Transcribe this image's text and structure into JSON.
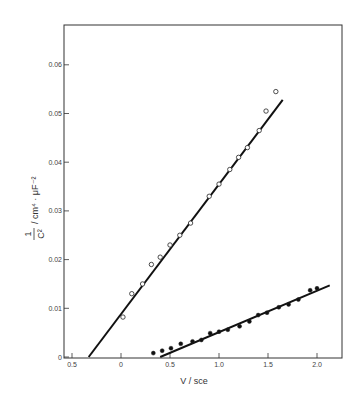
{
  "chart_data": {
    "type": "scatter",
    "title": "",
    "xlabel": "V / sce",
    "ylabel": "1/C² / cm⁴ · μF⁻²",
    "ylabel_parts": {
      "numerator": "1",
      "denominator": "C²",
      "units": "/ cm⁴ · μF⁻²"
    },
    "xlim": [
      -0.6,
      2.25
    ],
    "ylim": [
      0,
      0.068
    ],
    "x_ticks": [
      -0.5,
      0,
      0.5,
      1.0,
      1.5,
      2.0
    ],
    "x_tick_labels": [
      "0.5",
      "0",
      "0.5",
      "1.0",
      "1.5",
      "2.0"
    ],
    "y_ticks": [
      0,
      0.01,
      0.02,
      0.03,
      0.04,
      0.05,
      0.06
    ],
    "y_tick_labels": [
      "0",
      "0.01",
      "0.02",
      "0.03",
      "0.04",
      "0.05",
      "0.06"
    ],
    "grid": false,
    "legend": null,
    "series": [
      {
        "name": "open circles",
        "marker": "open-circle",
        "x": [
          0.02,
          0.11,
          0.22,
          0.31,
          0.4,
          0.5,
          0.6,
          0.71,
          0.9,
          1.0,
          1.11,
          1.2,
          1.29,
          1.41,
          1.48,
          1.58
        ],
        "values": [
          0.0082,
          0.013,
          0.015,
          0.019,
          0.0205,
          0.023,
          0.025,
          0.0275,
          0.033,
          0.0355,
          0.0385,
          0.041,
          0.043,
          0.0465,
          0.0505,
          0.0545
        ]
      },
      {
        "name": "filled circles",
        "marker": "filled-circle",
        "x": [
          0.33,
          0.42,
          0.51,
          0.61,
          0.73,
          0.82,
          0.91,
          1.0,
          1.09,
          1.21,
          1.31,
          1.4,
          1.49,
          1.61,
          1.71,
          1.81,
          1.93,
          2.0
        ],
        "values": [
          0.0008,
          0.0013,
          0.0018,
          0.0027,
          0.0032,
          0.0035,
          0.0049,
          0.0052,
          0.0056,
          0.0063,
          0.0073,
          0.0086,
          0.0091,
          0.0102,
          0.0108,
          0.0118,
          0.0137,
          0.0141
        ]
      }
    ],
    "fit_lines": [
      {
        "name": "fit open circles",
        "x": [
          -0.33,
          1.65
        ],
        "y": [
          0,
          0.0528
        ]
      },
      {
        "name": "fit filled circles",
        "x": [
          0.4,
          2.13
        ],
        "y": [
          0,
          0.0147
        ]
      }
    ]
  },
  "plot": {
    "x_axis_title": "V / sce",
    "y_axis_numerator": "1",
    "y_axis_denominator": "C²",
    "y_axis_units": "/ cm⁴ · μF⁻²"
  }
}
